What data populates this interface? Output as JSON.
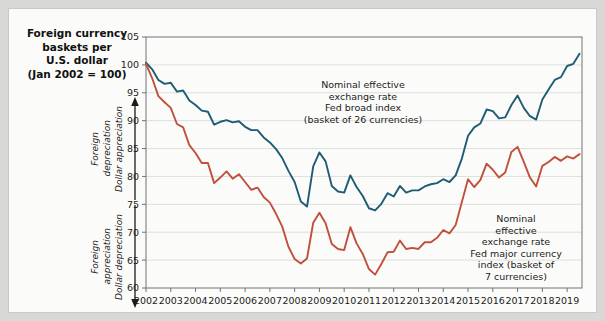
{
  "title": {
    "line1": "Foreign currency",
    "line2": "baskets per",
    "line3": "U.S. dollar",
    "line4": "(Jan 2002 = 100)"
  },
  "axis_annotations": {
    "up": {
      "arrow": "arrow-up-icon",
      "label1": "Foreign",
      "label2": "depreciation",
      "label3": "Dollar appreciation"
    },
    "down": {
      "arrow": "arrow-down-icon",
      "label1": "Foreign",
      "label2": "appreciation",
      "label3": "Dollar depreciation"
    }
  },
  "notes": {
    "broad": "Nominal effective exchange rate Fed broad index (basket of 26 currencies)",
    "broad_lines": [
      "Nominal effective",
      "exchange rate",
      "Fed broad index",
      "(basket of 26 currencies)"
    ],
    "major": "Nominal effective exchange rate Fed major currency index (basket of 7 currencies)",
    "major_lines": [
      "Nominal",
      "effective",
      "exchange rate",
      "Fed major currency",
      "index (basket of",
      "7 currencies)"
    ]
  },
  "colors": {
    "broad_index": "#1d5c74",
    "major_index": "#c0503c",
    "grid": "#d6d9d6",
    "frame": "#6e7478",
    "page_background": "#fbfbf9",
    "outer_background": "#d8d8d6"
  },
  "chart_data": {
    "type": "line",
    "title": "Foreign currency baskets per U.S. dollar (Jan 2002 = 100)",
    "xlabel": "",
    "ylabel": "Index (Jan 2002 = 100)",
    "ylim": [
      60,
      105
    ],
    "xlim": [
      2002,
      2019.6
    ],
    "yticks": [
      60,
      65,
      70,
      75,
      80,
      85,
      90,
      95,
      100,
      105
    ],
    "xticks": [
      2002,
      2003,
      2004,
      2005,
      2006,
      2007,
      2008,
      2009,
      2010,
      2011,
      2012,
      2013,
      2014,
      2015,
      2016,
      2017,
      2018,
      2019
    ],
    "grid": true,
    "legend": "annotations-inline",
    "series": [
      {
        "name": "Nominal effective exchange rate Fed broad index (basket of 26 currencies)",
        "color": "#1d5c74",
        "x": [
          2002.0,
          2002.25,
          2002.5,
          2002.75,
          2003.0,
          2003.25,
          2003.5,
          2003.75,
          2004.0,
          2004.25,
          2004.5,
          2004.75,
          2005.0,
          2005.25,
          2005.5,
          2005.75,
          2006.0,
          2006.25,
          2006.5,
          2006.75,
          2007.0,
          2007.25,
          2007.5,
          2007.75,
          2008.0,
          2008.25,
          2008.5,
          2008.75,
          2009.0,
          2009.25,
          2009.5,
          2009.75,
          2010.0,
          2010.25,
          2010.5,
          2010.75,
          2011.0,
          2011.25,
          2011.5,
          2011.75,
          2012.0,
          2012.25,
          2012.5,
          2012.75,
          2013.0,
          2013.25,
          2013.5,
          2013.75,
          2014.0,
          2014.25,
          2014.5,
          2014.75,
          2015.0,
          2015.25,
          2015.5,
          2015.75,
          2016.0,
          2016.25,
          2016.5,
          2016.75,
          2017.0,
          2017.25,
          2017.5,
          2017.75,
          2018.0,
          2018.25,
          2018.5,
          2018.75,
          2019.0,
          2019.25,
          2019.5
        ],
        "values": [
          100.4,
          99.2,
          97.3,
          96.6,
          96.8,
          95.2,
          95.4,
          93.6,
          92.8,
          91.8,
          91.6,
          89.3,
          89.8,
          90.1,
          89.7,
          89.9,
          88.9,
          88.3,
          88.3,
          87.0,
          86.1,
          84.9,
          83.3,
          81.0,
          79.0,
          75.5,
          74.6,
          81.8,
          84.3,
          82.7,
          78.3,
          77.3,
          77.1,
          80.2,
          78.1,
          76.5,
          74.3,
          73.9,
          75.1,
          77.0,
          76.4,
          78.3,
          77.1,
          77.5,
          77.5,
          78.2,
          78.6,
          78.8,
          79.5,
          79.0,
          80.2,
          83.2,
          87.3,
          88.8,
          89.5,
          92.0,
          91.7,
          90.4,
          90.6,
          92.8,
          94.5,
          92.3,
          90.8,
          90.2,
          93.8,
          95.6,
          97.3,
          97.8,
          99.8,
          100.2,
          102.0
        ]
      },
      {
        "name": "Nominal effective exchange rate Fed major currency index (basket of 7 currencies)",
        "color": "#c0503c",
        "x": [
          2002.0,
          2002.25,
          2002.5,
          2002.75,
          2003.0,
          2003.25,
          2003.5,
          2003.75,
          2004.0,
          2004.25,
          2004.5,
          2004.75,
          2005.0,
          2005.25,
          2005.5,
          2005.75,
          2006.0,
          2006.25,
          2006.5,
          2006.75,
          2007.0,
          2007.25,
          2007.5,
          2007.75,
          2008.0,
          2008.25,
          2008.5,
          2008.75,
          2009.0,
          2009.25,
          2009.5,
          2009.75,
          2010.0,
          2010.25,
          2010.5,
          2010.75,
          2011.0,
          2011.25,
          2011.5,
          2011.75,
          2012.0,
          2012.25,
          2012.5,
          2012.75,
          2013.0,
          2013.25,
          2013.5,
          2013.75,
          2014.0,
          2014.25,
          2014.5,
          2014.75,
          2015.0,
          2015.25,
          2015.5,
          2015.75,
          2016.0,
          2016.25,
          2016.5,
          2016.75,
          2017.0,
          2017.25,
          2017.5,
          2017.75,
          2018.0,
          2018.25,
          2018.5,
          2018.75,
          2019.0,
          2019.25,
          2019.5
        ],
        "values": [
          100.2,
          97.6,
          94.4,
          93.3,
          92.3,
          89.4,
          88.8,
          85.6,
          84.2,
          82.4,
          82.4,
          78.8,
          79.8,
          80.9,
          79.6,
          80.4,
          79.0,
          77.6,
          78.0,
          76.3,
          75.3,
          73.3,
          71.0,
          67.4,
          65.2,
          64.4,
          65.3,
          71.7,
          73.5,
          71.6,
          67.9,
          67.0,
          66.8,
          70.9,
          68.0,
          66.1,
          63.4,
          62.4,
          64.3,
          66.4,
          66.5,
          68.5,
          67.0,
          67.2,
          67.0,
          68.2,
          68.2,
          69.0,
          70.4,
          69.8,
          71.3,
          75.4,
          79.5,
          78.1,
          79.4,
          82.3,
          81.2,
          79.8,
          80.7,
          84.4,
          85.3,
          82.6,
          79.8,
          78.2,
          81.9,
          82.6,
          83.5,
          82.8,
          83.6,
          83.2,
          84.0
        ]
      }
    ]
  }
}
